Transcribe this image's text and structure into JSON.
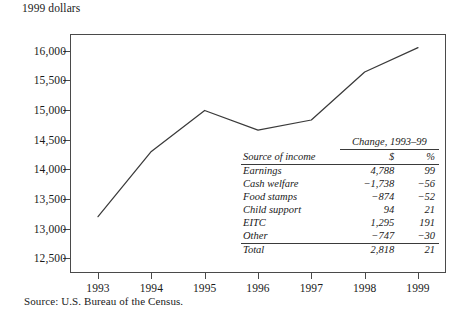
{
  "axis_caption": "1999 dollars",
  "source_note": "Source: U.S. Bureau of the Census.",
  "inset": {
    "span_header": "Change, 1993–99",
    "col_source": "Source of income",
    "col_dollar": "$",
    "col_pct": "%",
    "rows": [
      {
        "label": "Earnings",
        "dollar": "4,788",
        "pct": "99"
      },
      {
        "label": "Cash welfare",
        "dollar": "−1,738",
        "pct": "−56"
      },
      {
        "label": "Food stamps",
        "dollar": "−874",
        "pct": "−52"
      },
      {
        "label": "Child support",
        "dollar": "94",
        "pct": "21"
      },
      {
        "label": "EITC",
        "dollar": "1,295",
        "pct": "191"
      },
      {
        "label": "Other",
        "dollar": "−747",
        "pct": "−30"
      }
    ],
    "total": {
      "label": "Total",
      "dollar": "2,818",
      "pct": "21"
    }
  },
  "chart_data": {
    "type": "line",
    "title": "",
    "xlabel": "",
    "ylabel": "1999 dollars",
    "x": [
      1993,
      1994,
      1995,
      1996,
      1997,
      1998,
      1999
    ],
    "xticklabels": [
      "1993",
      "1994",
      "1995",
      "1996",
      "1997",
      "1998",
      "1999"
    ],
    "values": [
      13200,
      14300,
      14990,
      14660,
      14830,
      15640,
      16050
    ],
    "series": [
      {
        "name": "Mean income",
        "values": [
          13200,
          14300,
          14990,
          14660,
          14830,
          15640,
          16050
        ]
      }
    ],
    "ylim": [
      12250,
      16280
    ],
    "yticks": [
      12500,
      13000,
      13500,
      14000,
      14500,
      15000,
      15500,
      16000
    ],
    "yticklabels": [
      "12,500",
      "13,000",
      "13,500",
      "14,000",
      "14,500",
      "15,000",
      "15,500",
      "16,000"
    ],
    "grid": false,
    "legend": false,
    "line_color": "#3a3a3a"
  }
}
